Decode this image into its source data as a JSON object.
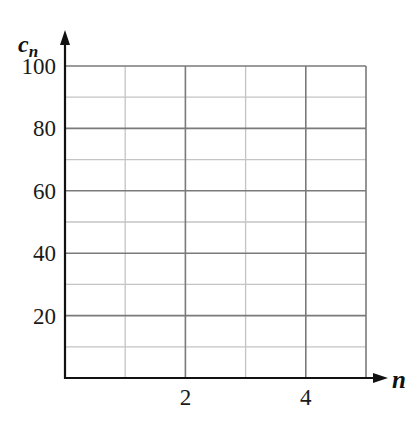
{
  "chart_data": {
    "type": "line",
    "title": "",
    "xlabel": "n",
    "ylabel": "c_n",
    "ylabel_main": "c",
    "ylabel_sub": "n",
    "xlim": [
      0,
      5
    ],
    "ylim": [
      0,
      100
    ],
    "x_ticks": [
      {
        "value": 2,
        "label": "2"
      },
      {
        "value": 4,
        "label": "4"
      }
    ],
    "y_ticks": [
      {
        "value": 20,
        "label": "20"
      },
      {
        "value": 40,
        "label": "40"
      },
      {
        "value": 60,
        "label": "60"
      },
      {
        "value": 80,
        "label": "80"
      },
      {
        "value": 100,
        "label": "100"
      }
    ],
    "grid": true,
    "grid_major_x": [
      2,
      4
    ],
    "grid_minor_x": [
      1,
      3,
      5
    ],
    "grid_major_y": [
      20,
      40,
      60,
      80,
      100
    ],
    "grid_minor_y": [
      10,
      30,
      50,
      70,
      90
    ],
    "series": [],
    "legend": null
  },
  "colors": {
    "axis": "#111111",
    "grid_major": "#7a7a7a",
    "grid_minor": "#c4c4c4",
    "text": "#1a1a1a"
  }
}
